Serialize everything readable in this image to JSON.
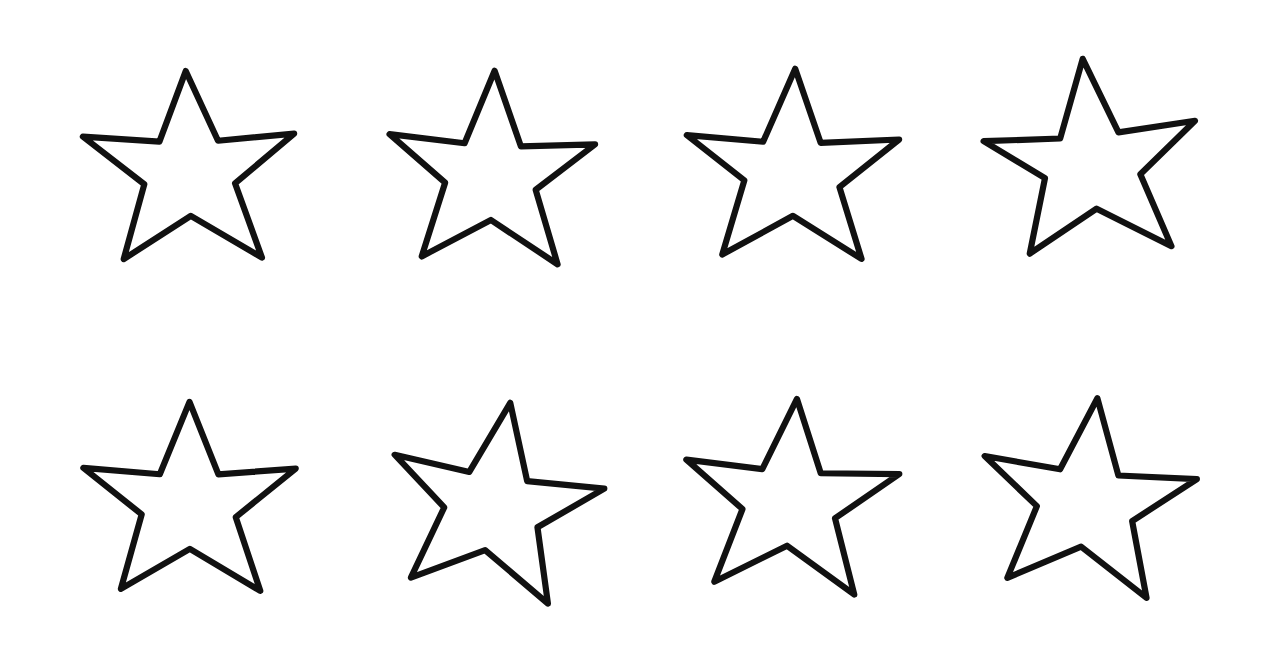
{
  "document": {
    "title": "Hand-drawn five-pointed star outlines",
    "description": "Eight hand-drawn five-pointed star outlines arranged in two rows of four on a plain white background.",
    "background_color": "#ffffff",
    "ink_color": "#111111",
    "stroke_width_px": 5.6,
    "canvas": {
      "width": 1282,
      "height": 662
    },
    "rows": 2,
    "columns": 4,
    "shape_count": 8,
    "shape_name": "five-pointed star",
    "style": "hand-drawn outline, unfilled"
  },
  "stars": [
    {
      "id": "star-1",
      "label": "Star 1",
      "row": 1,
      "column": 1,
      "left": 75,
      "top": 40,
      "rotation_deg": -2,
      "points": "100,28 127,92 196,88 141,131 163,199 100,159 38,196 59,129 5,84 74,91"
    },
    {
      "id": "star-2",
      "label": "Star 2",
      "row": 1,
      "column": 2,
      "left": 378,
      "top": 42,
      "rotation_deg": 1,
      "points": "101,26 126,94 193,91 140,133 161,200 100,161 38,195 58,128 7,85 75,92"
    },
    {
      "id": "star-3",
      "label": "Star 3",
      "row": 1,
      "column": 3,
      "left": 678,
      "top": 40,
      "rotation_deg": 0,
      "points": "103,26 126,93 197,90 143,133 163,198 101,159 37,194 57,127 5,86 74,92"
    },
    {
      "id": "star-4",
      "label": "Star 4",
      "row": 1,
      "column": 4,
      "left": 976,
      "top": 32,
      "rotation_deg": -7,
      "points": "104,24 128,94 198,92 143,134 163,202 100,160 35,193 57,127 6,87 75,93"
    },
    {
      "id": "star-5",
      "label": "Star 5",
      "row": 2,
      "column": 1,
      "left": 75,
      "top": 372,
      "rotation_deg": -1,
      "points": "102,27 127,93 197,89 142,132 163,199 100,160 37,195 57,128 5,85 74,92"
    },
    {
      "id": "star-6",
      "label": "Star 6",
      "row": 2,
      "column": 2,
      "left": 380,
      "top": 374,
      "rotation_deg": 8,
      "points": "103,25 128,93 198,90 143,133 162,200 99,160 36,194 57,127 6,86 75,92"
    },
    {
      "id": "star-7",
      "label": "Star 7",
      "row": 2,
      "column": 3,
      "left": 676,
      "top": 370,
      "rotation_deg": 3,
      "points": "102,26 127,92 198,89 142,132 163,200 100,159 36,195 58,128 5,86 74,91"
    },
    {
      "id": "star-8",
      "label": "Star 8",
      "row": 2,
      "column": 4,
      "left": 972,
      "top": 370,
      "rotation_deg": 5,
      "points": "103,25 128,93 199,90 144,133 163,201 100,160 36,194 57,127 6,86 75,92"
    }
  ]
}
